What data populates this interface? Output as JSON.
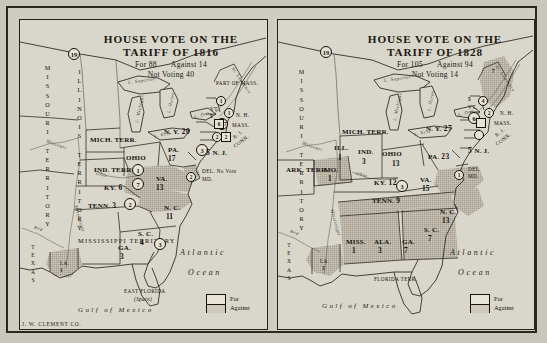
{
  "document": {
    "kind": "historical-map-plate",
    "imprint": "J. W. CLEMENT CO."
  },
  "maps": [
    {
      "id": "tariff-1816",
      "title_line1": "HOUSE VOTE ON THE",
      "title_line2": "TARIFF OF 1816",
      "for_label": "For 88",
      "against_label": "Against 14",
      "not_voting_label": "Not Voting 40",
      "ocean_label_line1": "Atlantic",
      "ocean_label_line2": "Ocean",
      "gulf_label": "Gulf of Mexico",
      "legend": {
        "for": "For",
        "against": "Against"
      },
      "territories": [
        "MISSOURI TERRITORY",
        "ILLINOIS TERRITORY",
        "MISSISSIPPI TERRITORY",
        "MICH. TERR.",
        "IND. TERR.",
        "PART OF MASS.",
        "TEXAS",
        "EAST FLORIDA",
        "(Spain)"
      ],
      "states": [
        {
          "name": "N. Y.",
          "for_votes": "20",
          "against_votes": "2",
          "shaded": false
        },
        {
          "name": "PA.",
          "for_votes": "17",
          "against_votes": "3",
          "shaded": false
        },
        {
          "name": "OHIO",
          "for_votes": "4",
          "against_votes": "",
          "shaded": false
        },
        {
          "name": "VA.",
          "for_votes": "13",
          "against_votes": "7",
          "shaded": true
        },
        {
          "name": "KY.",
          "for_votes": "6",
          "against_votes": "1",
          "shaded": false
        },
        {
          "name": "TENN.",
          "for_votes": "3",
          "against_votes": "2",
          "shaded": false
        },
        {
          "name": "N. C.",
          "for_votes": "11",
          "against_votes": "",
          "shaded": true
        },
        {
          "name": "S. C.",
          "for_votes": "4",
          "against_votes": "3",
          "shaded": false
        },
        {
          "name": "GA.",
          "for_votes": "3",
          "against_votes": "",
          "shaded": false
        },
        {
          "name": "N. J.",
          "for_votes": "5",
          "against_votes": "",
          "shaded": false
        },
        {
          "name": "DEL.",
          "for_votes": "No Vote",
          "against_votes": "",
          "shaded": false
        },
        {
          "name": "MD.",
          "for_votes": "",
          "against_votes": "2",
          "shaded": true
        },
        {
          "name": "VT.",
          "for_votes": "5",
          "against_votes": "1",
          "shaded": false
        },
        {
          "name": "N. H.",
          "for_votes": "",
          "against_votes": "1",
          "shaded": false
        },
        {
          "name": "MASS.",
          "for_votes": "7",
          "against_votes": "6",
          "shaded": false
        },
        {
          "name": "CONN.",
          "for_votes": "",
          "against_votes": "2",
          "shaded": false
        },
        {
          "name": "R. I.",
          "for_votes": "",
          "against_votes": "2",
          "shaded": false
        },
        {
          "name": "LA.",
          "for_votes": "1",
          "against_votes": "",
          "shaded": true
        }
      ],
      "water_labels": [
        "L. Superior",
        "L. Michigan",
        "L. Huron",
        "L. Erie",
        "L. Ont.",
        "St. Lawrence",
        "Missouri",
        "Mississippi",
        "Ohio",
        "Red",
        "R."
      ]
    },
    {
      "id": "tariff-1828",
      "title_line1": "HOUSE VOTE ON THE",
      "title_line2": "TARIFF OF 1828",
      "for_label": "For 105",
      "against_label": "Against 94",
      "not_voting_label": "Not Voting 14",
      "ocean_label_line1": "Atlantic",
      "ocean_label_line2": "Ocean",
      "gulf_label": "Gulf of Mexico",
      "legend": {
        "for": "For",
        "against": "Against"
      },
      "territories": [
        "MISSOURI TERRITORY",
        "MICH. TERR.",
        "ARK. TERR.",
        "FLORIDA TERR.",
        "TEXAS",
        "MAINE"
      ],
      "states": [
        {
          "name": "N. Y.",
          "for_votes": "27",
          "against_votes": "6",
          "shaded": false
        },
        {
          "name": "PA.",
          "for_votes": "23",
          "against_votes": "",
          "shaded": false
        },
        {
          "name": "OHIO",
          "for_votes": "13",
          "against_votes": "",
          "shaded": false
        },
        {
          "name": "IND.",
          "for_votes": "3",
          "against_votes": "",
          "shaded": false
        },
        {
          "name": "ILL.",
          "for_votes": "1",
          "against_votes": "",
          "shaded": false
        },
        {
          "name": "MO.",
          "for_votes": "1",
          "against_votes": "",
          "shaded": true
        },
        {
          "name": "KY.",
          "for_votes": "12",
          "against_votes": "",
          "shaded": false
        },
        {
          "name": "VA.",
          "for_votes": "15",
          "against_votes": "3",
          "shaded": true
        },
        {
          "name": "TENN.",
          "for_votes": "9",
          "against_votes": "",
          "shaded": true
        },
        {
          "name": "N. C.",
          "for_votes": "13",
          "against_votes": "",
          "shaded": true
        },
        {
          "name": "S. C.",
          "for_votes": "7",
          "against_votes": "",
          "shaded": true
        },
        {
          "name": "GA.",
          "for_votes": "7",
          "against_votes": "",
          "shaded": true
        },
        {
          "name": "ALA.",
          "for_votes": "3",
          "against_votes": "",
          "shaded": true
        },
        {
          "name": "MISS.",
          "for_votes": "1",
          "against_votes": "",
          "shaded": true
        },
        {
          "name": "LA.",
          "for_votes": "3",
          "against_votes": "",
          "shaded": true
        },
        {
          "name": "N. J.",
          "for_votes": "5",
          "against_votes": "",
          "shaded": false
        },
        {
          "name": "DEL.",
          "for_votes": "1",
          "against_votes": "",
          "shaded": false
        },
        {
          "name": "MD.",
          "for_votes": "",
          "against_votes": "",
          "shaded": false
        },
        {
          "name": "VT.",
          "for_votes": "5",
          "against_votes": "4",
          "shaded": false
        },
        {
          "name": "N. H.",
          "for_votes": "",
          "against_votes": "2",
          "shaded": false
        },
        {
          "name": "MASS.",
          "for_votes": "",
          "against_votes": "",
          "shaded": false
        },
        {
          "name": "CONN.",
          "for_votes": "",
          "against_votes": "",
          "shaded": false
        },
        {
          "name": "R. I.",
          "for_votes": "",
          "against_votes": "",
          "shaded": false
        },
        {
          "name": "MAINE",
          "for_votes": "",
          "against_votes": "7",
          "shaded": true
        }
      ],
      "water_labels": [
        "L. Superior",
        "L. Michigan",
        "L. Huron",
        "L. Erie",
        "L. Ont.",
        "St. Lawrence",
        "Missouri",
        "Mississippi",
        "Ohio",
        "Red",
        "R."
      ]
    }
  ]
}
